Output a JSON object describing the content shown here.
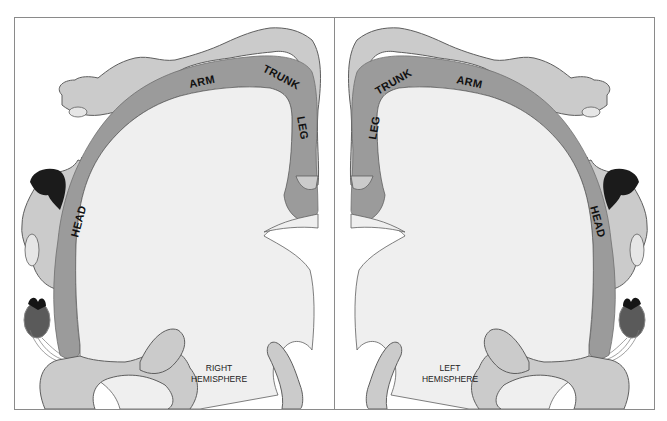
{
  "figure": {
    "panels": [
      {
        "side": "right",
        "caption_line1": "RIGHT",
        "caption_line2": "HEMISPHERE",
        "labels": {
          "arm": "ARM",
          "trunk": "TRUNK",
          "leg": "LEG",
          "head": "HEAD"
        }
      },
      {
        "side": "left",
        "caption_line1": "LEFT",
        "caption_line2": "HEMISPHERE",
        "labels": {
          "arm": "ARM",
          "trunk": "TRUNK",
          "leg": "LEG",
          "head": "HEAD"
        }
      }
    ],
    "colors": {
      "frame": "#8a8a8a",
      "cortex_band": "#9b9b9b",
      "body_figure": "#cbcbcb",
      "white_matter": "#efefef",
      "outline": "#5e5e5e",
      "hair": "#1b1b1b",
      "heart": "#5a5a5a",
      "heart_top": "#151515"
    }
  }
}
